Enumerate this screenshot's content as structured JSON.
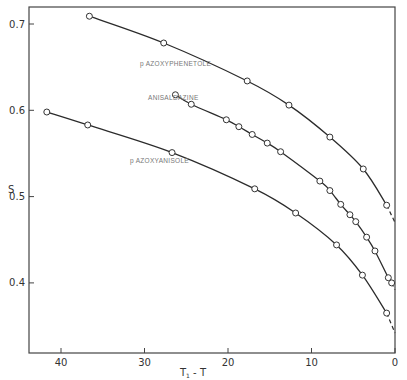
{
  "chart_data": {
    "type": "line",
    "title": "",
    "xlabel": "T₁ - T",
    "ylabel": "S",
    "xlim": [
      44,
      0
    ],
    "ylim": [
      0.34,
      0.72
    ],
    "x_ticks": [
      40,
      30,
      20,
      10,
      0
    ],
    "x_tick_labels": [
      "40",
      "30",
      "20",
      "10",
      "0"
    ],
    "y_ticks": [
      0.7,
      0.6,
      0.5,
      0.4
    ],
    "y_tick_labels": [
      "0.7",
      "0.6",
      "0.5",
      "0.4"
    ],
    "grid": false,
    "legend": "inline labels",
    "series": [
      {
        "name": "p AZOXYPHENETOLE",
        "marker": "open-circle",
        "x": [
          36.6,
          27.7,
          17.7,
          12.7,
          7.8,
          3.8,
          1.0
        ],
        "y": [
          0.709,
          0.678,
          0.634,
          0.606,
          0.569,
          0.532,
          0.49
        ],
        "extrapolated_to": [
          0,
          0.47
        ]
      },
      {
        "name": "ANISALDAZINE",
        "marker": "open-circle",
        "x": [
          26.3,
          24.4,
          20.2,
          18.7,
          17.1,
          15.3,
          13.7,
          9.0,
          7.8,
          6.5,
          5.4,
          4.7,
          3.4,
          2.4,
          0.8,
          0.4
        ],
        "y": [
          0.618,
          0.607,
          0.589,
          0.581,
          0.572,
          0.562,
          0.552,
          0.518,
          0.507,
          0.491,
          0.479,
          0.471,
          0.453,
          0.437,
          0.406,
          0.4
        ],
        "extrapolated_to": [
          0,
          0.392
        ]
      },
      {
        "name": "p AZOXYANISOLE",
        "marker": "open-circle",
        "x": [
          41.7,
          36.8,
          26.7,
          16.8,
          11.9,
          7.0,
          3.9,
          1.0
        ],
        "y": [
          0.598,
          0.583,
          0.551,
          0.509,
          0.481,
          0.444,
          0.409,
          0.365
        ],
        "extrapolated_to": [
          0,
          0.342
        ]
      }
    ]
  },
  "labels": {
    "phenetole": "p  AZOXYPHENETOLE",
    "anisaldazine": "ANISALDAZINE",
    "anisole": "p  AZOXYANISOLE",
    "y_axis": "S",
    "x_axis_main": "T",
    "x_axis_sub": "1",
    "x_axis_rest": " - T"
  }
}
